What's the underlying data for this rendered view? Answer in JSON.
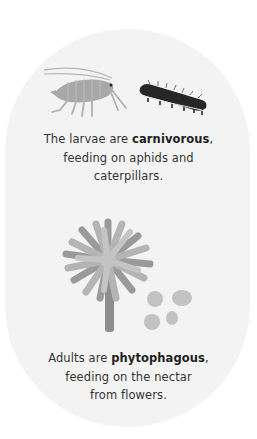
{
  "section_1": {
    "text_before": "The larvae are ",
    "bold": "carnivorous",
    "text_after_line1": ",",
    "line2": "feeding on aphids and",
    "line3": "caterpillars."
  },
  "section_2": {
    "text_before": "Adults are ",
    "bold": "phytophagous",
    "text_after_line1": ",",
    "line2": "feeding on the nectar",
    "line3": "from flowers."
  },
  "icons": [
    "aphid-icon",
    "caterpillar-icon",
    "flower-icon",
    "pollen-icon"
  ],
  "colors": {
    "background": "#ffffff",
    "pill": "#f3f3f3",
    "illustration_gray": "#a9a9a9",
    "caterpillar": "#2a2a2a",
    "text": "#333333"
  }
}
